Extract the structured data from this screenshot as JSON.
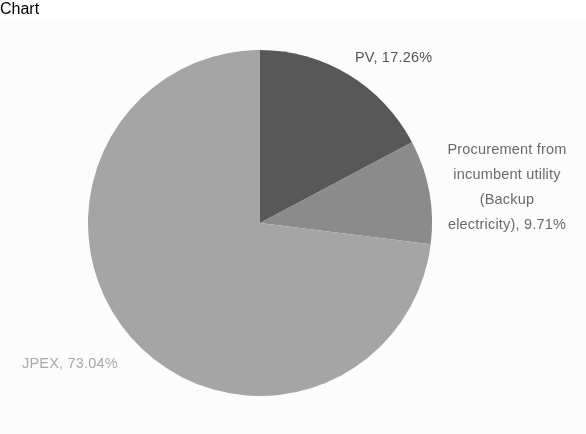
{
  "chart_data": {
    "type": "pie",
    "title": "",
    "subtitle": "",
    "xlabel": "",
    "ylabel": "",
    "legend_position": "none",
    "grid": false,
    "units": "%",
    "start_angle_deg": 0,
    "direction": "clockwise",
    "categories": [
      "PV",
      "Procurement from incumbent utility (Backup electricity)",
      "JPEX"
    ],
    "values": [
      17.26,
      9.71,
      73.04
    ],
    "colors": [
      "#595959",
      "#8c8c8c",
      "#a6a6a6"
    ],
    "slices": [
      {
        "name": "PV",
        "value": 17.26,
        "color": "#595959",
        "label_text": "PV, 17.26%",
        "label_color": "#545454",
        "start_deg": 0,
        "end_deg": 62.14
      },
      {
        "name": "Procurement from incumbent utility (Backup electricity)",
        "value": 9.71,
        "color": "#8c8c8c",
        "label_color": "#6b6b6b",
        "label_lines": [
          "Procurement from",
          "incumbent utility",
          "(Backup",
          "electricity), 9.71%"
        ],
        "start_deg": 62.14,
        "end_deg": 97.09
      },
      {
        "name": "JPEX",
        "value": 73.04,
        "color": "#a6a6a6",
        "label_text": "JPEX, 73.04%",
        "label_color": "#aaaaaa",
        "start_deg": 97.09,
        "end_deg": 360
      }
    ],
    "geometry": {
      "center_x": 260,
      "center_y": 205,
      "radius_x": 172,
      "radius_y": 173
    },
    "background": "#ffffff"
  }
}
